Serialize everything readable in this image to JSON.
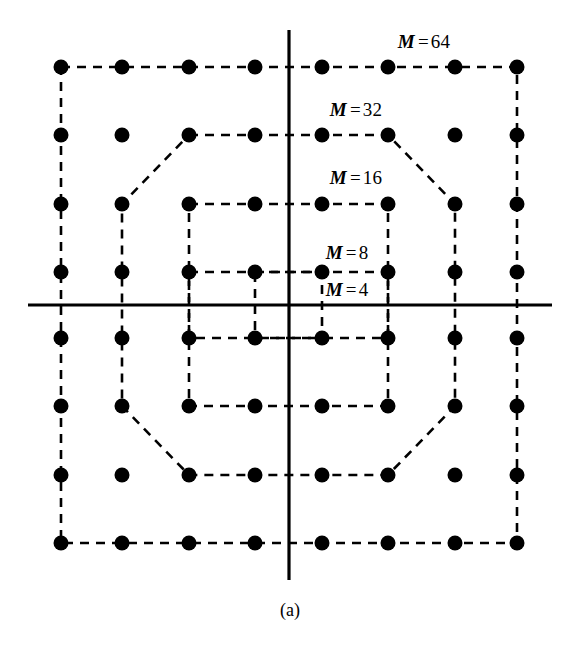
{
  "figure": {
    "caption": "(a)",
    "caption_x": 290,
    "caption_y": 610,
    "width": 571,
    "height": 651,
    "background": "#ffffff",
    "ink_color": "#000000"
  },
  "axes": {
    "horizontal": {
      "x1": 28,
      "y1": 305,
      "x2": 552,
      "y2": 305,
      "width": 3.2
    },
    "vertical": {
      "x1": 289,
      "y1": 30,
      "x2": 289,
      "y2": 580,
      "width": 3.2
    }
  },
  "grid": {
    "columns_px": [
      61,
      122,
      189,
      255,
      322,
      388,
      455,
      517
    ],
    "rows_px": [
      67,
      135,
      204,
      272,
      338,
      406,
      475,
      543
    ],
    "dot_radius": 7.5,
    "dash_pattern": "9,7",
    "dash_width": 2.6
  },
  "labels": [
    {
      "name": "m-64-label",
      "var": "M",
      "eq": "=",
      "num": "64",
      "text": "M = 64",
      "x": 424,
      "y": 42
    },
    {
      "name": "m-32-label",
      "var": "M",
      "eq": "=",
      "num": "32",
      "text": "M = 32",
      "x": 356,
      "y": 110
    },
    {
      "name": "m-16-label",
      "var": "M",
      "eq": "=",
      "num": "16",
      "text": "M = 16",
      "x": 356,
      "y": 178
    },
    {
      "name": "m-8-label",
      "var": "M",
      "eq": "=",
      "num": "8",
      "text": "M = 8",
      "x": 347,
      "y": 253
    },
    {
      "name": "m-4-label",
      "var": "M",
      "eq": "=",
      "num": "4",
      "text": "M = 4",
      "x": 347,
      "y": 290
    }
  ],
  "chart_data": {
    "type": "scatter",
    "title": "",
    "subtitle": "",
    "xlabel": "",
    "ylabel": "",
    "grid": false,
    "legend_position": "inline-annotations",
    "annotations": [
      "M = 64",
      "M = 32",
      "M = 16",
      "M = 8",
      "M = 4",
      "(a)"
    ],
    "axis_ranges": {
      "x": [
        -4,
        4
      ],
      "y": [
        -4,
        4
      ]
    },
    "lattice": {
      "x_levels": [
        -7,
        -5,
        -3,
        -1,
        1,
        3,
        5,
        7
      ],
      "y_levels": [
        7,
        5,
        3,
        1,
        -1,
        -3,
        -5,
        -7
      ]
    },
    "points": [
      {
        "x": -7,
        "y": 7
      },
      {
        "x": -5,
        "y": 7
      },
      {
        "x": -3,
        "y": 7
      },
      {
        "x": -1,
        "y": 7
      },
      {
        "x": 1,
        "y": 7
      },
      {
        "x": 3,
        "y": 7
      },
      {
        "x": 5,
        "y": 7
      },
      {
        "x": 7,
        "y": 7
      },
      {
        "x": -7,
        "y": 5
      },
      {
        "x": -5,
        "y": 5
      },
      {
        "x": -3,
        "y": 5
      },
      {
        "x": -1,
        "y": 5
      },
      {
        "x": 1,
        "y": 5
      },
      {
        "x": 3,
        "y": 5
      },
      {
        "x": 5,
        "y": 5
      },
      {
        "x": 7,
        "y": 5
      },
      {
        "x": -7,
        "y": 3
      },
      {
        "x": -5,
        "y": 3
      },
      {
        "x": -3,
        "y": 3
      },
      {
        "x": -1,
        "y": 3
      },
      {
        "x": 1,
        "y": 3
      },
      {
        "x": 3,
        "y": 3
      },
      {
        "x": 5,
        "y": 3
      },
      {
        "x": 7,
        "y": 3
      },
      {
        "x": -7,
        "y": 1
      },
      {
        "x": -5,
        "y": 1
      },
      {
        "x": -3,
        "y": 1
      },
      {
        "x": -1,
        "y": 1
      },
      {
        "x": 1,
        "y": 1
      },
      {
        "x": 3,
        "y": 1
      },
      {
        "x": 5,
        "y": 1
      },
      {
        "x": 7,
        "y": 1
      },
      {
        "x": -7,
        "y": -1
      },
      {
        "x": -5,
        "y": -1
      },
      {
        "x": -3,
        "y": -1
      },
      {
        "x": -1,
        "y": -1
      },
      {
        "x": 1,
        "y": -1
      },
      {
        "x": 3,
        "y": -1
      },
      {
        "x": 5,
        "y": -1
      },
      {
        "x": 7,
        "y": -1
      },
      {
        "x": -7,
        "y": -3
      },
      {
        "x": -5,
        "y": -3
      },
      {
        "x": -3,
        "y": -3
      },
      {
        "x": -1,
        "y": -3
      },
      {
        "x": 1,
        "y": -3
      },
      {
        "x": 3,
        "y": -3
      },
      {
        "x": 5,
        "y": -3
      },
      {
        "x": 7,
        "y": -3
      },
      {
        "x": -7,
        "y": -5
      },
      {
        "x": -5,
        "y": -5
      },
      {
        "x": -3,
        "y": -5
      },
      {
        "x": -1,
        "y": -5
      },
      {
        "x": 1,
        "y": -5
      },
      {
        "x": 3,
        "y": -5
      },
      {
        "x": 5,
        "y": -5
      },
      {
        "x": 7,
        "y": -5
      },
      {
        "x": -7,
        "y": -7
      },
      {
        "x": -5,
        "y": -7
      },
      {
        "x": -3,
        "y": -7
      },
      {
        "x": -1,
        "y": -7
      },
      {
        "x": 1,
        "y": -7
      },
      {
        "x": 3,
        "y": -7
      },
      {
        "x": 5,
        "y": -7
      },
      {
        "x": 7,
        "y": -7
      }
    ],
    "boundaries": [
      {
        "name": "M = 4",
        "M": 4,
        "shape": "square",
        "vertices_px": [
          [
            255,
            272
          ],
          [
            322,
            272
          ],
          [
            322,
            338
          ],
          [
            255,
            338
          ]
        ]
      },
      {
        "name": "M = 8",
        "M": 8,
        "shape": "rectangle",
        "vertices_px": [
          [
            189,
            272
          ],
          [
            388,
            272
          ],
          [
            388,
            338
          ],
          [
            189,
            338
          ]
        ]
      },
      {
        "name": "M = 16",
        "M": 16,
        "shape": "square",
        "vertices_px": [
          [
            189,
            204
          ],
          [
            388,
            204
          ],
          [
            388,
            406
          ],
          [
            189,
            406
          ]
        ]
      },
      {
        "name": "M = 32",
        "M": 32,
        "shape": "octagon",
        "vertices_px": [
          [
            189,
            135
          ],
          [
            388,
            135
          ],
          [
            455,
            204
          ],
          [
            455,
            406
          ],
          [
            388,
            475
          ],
          [
            189,
            475
          ],
          [
            122,
            406
          ],
          [
            122,
            204
          ]
        ]
      },
      {
        "name": "M = 64",
        "M": 64,
        "shape": "square",
        "vertices_px": [
          [
            61,
            67
          ],
          [
            517,
            67
          ],
          [
            517,
            543
          ],
          [
            61,
            543
          ]
        ]
      }
    ]
  }
}
